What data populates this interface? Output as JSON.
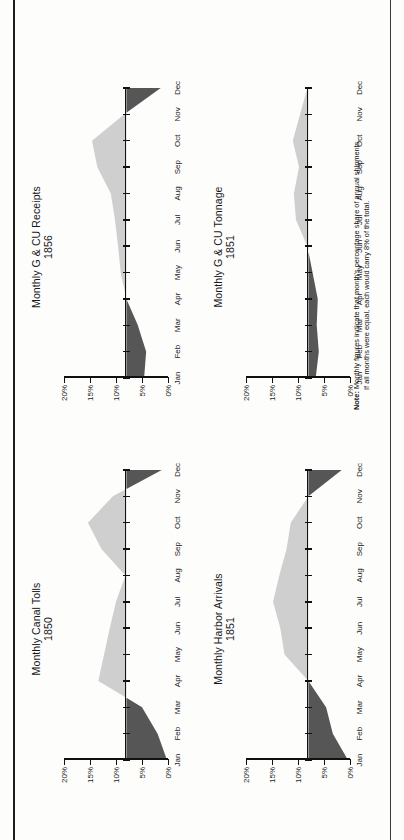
{
  "page": {
    "orientation": "landscape-rotated-90ccw",
    "background": "#fdfdfc",
    "ink": "#111111"
  },
  "colors": {
    "below_baseline": "#565656",
    "above_baseline": "#cfcfcf",
    "axis": "#111111",
    "text": "#17171a"
  },
  "note": {
    "label": "Note:",
    "line1": "Monthly figures indicate that month's percentage share of annual shipments.",
    "line2": "If all months were equal, each would carry 8% of the total."
  },
  "axis": {
    "y_ticks": [
      "0%",
      "5%",
      "10%",
      "15%",
      "20%"
    ],
    "y_values": [
      0,
      5,
      10,
      15,
      20
    ],
    "x_ticks": [
      "Jan",
      "Feb",
      "Mar",
      "Apr",
      "May",
      "Jun",
      "Jul",
      "Aug",
      "Sep",
      "Oct",
      "Nov",
      "Dec"
    ]
  },
  "chart_data": [
    {
      "type": "area",
      "title": "Monthly Canal Tolls",
      "subtitle": "1850",
      "xlabel": "",
      "ylabel": "",
      "ylim": [
        0,
        20
      ],
      "baseline": 8,
      "grid": false,
      "legend": "none",
      "categories": [
        "Jan",
        "Feb",
        "Mar",
        "Apr",
        "May",
        "Jun",
        "Jul",
        "Aug",
        "Sep",
        "Oct",
        "Nov",
        "Dec"
      ],
      "values": [
        0.2,
        2.0,
        5.0,
        13.4,
        12.3,
        11.2,
        10.0,
        8.2,
        12.8,
        15.4,
        10.6,
        1.2
      ]
    },
    {
      "type": "area",
      "title": "Monthly G & CU Receipts",
      "subtitle": "1856",
      "xlabel": "",
      "ylabel": "",
      "ylim": [
        0,
        20
      ],
      "baseline": 8,
      "grid": false,
      "legend": "none",
      "categories": [
        "Jan",
        "Feb",
        "Mar",
        "Apr",
        "May",
        "Jun",
        "Jul",
        "Aug",
        "Sep",
        "Oct",
        "Nov",
        "Dec"
      ],
      "values": [
        4.6,
        4.2,
        5.8,
        8.0,
        9.1,
        9.6,
        10.2,
        11.0,
        13.6,
        14.6,
        8.4,
        1.4
      ]
    },
    {
      "type": "area",
      "title": "Monthly Harbor Arrivals",
      "subtitle": "1851",
      "xlabel": "",
      "ylabel": "",
      "ylim": [
        0,
        20
      ],
      "baseline": 8,
      "grid": false,
      "legend": "none",
      "categories": [
        "Jan",
        "Feb",
        "Mar",
        "Apr",
        "May",
        "Jun",
        "Jul",
        "Aug",
        "Sep",
        "Oct",
        "Nov",
        "Dec"
      ],
      "values": [
        0.4,
        3.3,
        4.6,
        8.0,
        12.6,
        13.4,
        14.8,
        13.6,
        12.2,
        11.4,
        8.0,
        1.6
      ]
    },
    {
      "type": "area",
      "title": "Monthly G & CU Tonnage",
      "subtitle": "1851",
      "xlabel": "",
      "ylabel": "",
      "ylim": [
        0,
        20
      ],
      "baseline": 8,
      "grid": false,
      "legend": "none",
      "categories": [
        "Jan",
        "Feb",
        "Mar",
        "Apr",
        "May",
        "Jun",
        "Jul",
        "Aug",
        "Sep",
        "Oct",
        "Nov",
        "Dec"
      ],
      "values": [
        6.6,
        6.0,
        6.4,
        6.2,
        7.2,
        8.2,
        10.4,
        10.8,
        9.8,
        11.0,
        9.6,
        8.2
      ]
    }
  ]
}
